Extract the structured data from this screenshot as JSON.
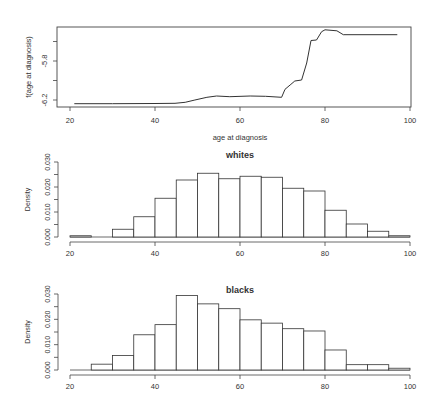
{
  "colors": {
    "ink": "#444444",
    "bar_fill": "#ffffff",
    "background": "#ffffff"
  },
  "chart_data": [
    {
      "type": "line",
      "title": "",
      "xlabel": "age at diagnosis",
      "ylabel": "f(age at diagnosis)",
      "xlim": [
        20,
        100
      ],
      "ylim": [
        -6.25,
        -5.45
      ],
      "xticks": [
        20,
        40,
        60,
        80,
        100
      ],
      "yticks": [
        -6.2,
        -6.0,
        -5.8,
        -5.6
      ],
      "ytick_labels": [
        "-6.2",
        "",
        "-5.8",
        ""
      ],
      "grid": false,
      "series": [
        {
          "name": "f(age at diagnosis)",
          "x": [
            21,
            30,
            40,
            44.7,
            47.1,
            49.4,
            52.2,
            54.5,
            57.6,
            62.4,
            66,
            69.8,
            70.6,
            71.8,
            72.9,
            74.5,
            75.7,
            76.7,
            78.0,
            79.2,
            80.0,
            82.8,
            84.3,
            97.0
          ],
          "y": [
            -6.238,
            -6.238,
            -6.236,
            -6.234,
            -6.224,
            -6.2,
            -6.172,
            -6.159,
            -6.166,
            -6.159,
            -6.162,
            -6.172,
            -6.09,
            -6.046,
            -6.005,
            -5.995,
            -5.82,
            -5.59,
            -5.585,
            -5.5,
            -5.48,
            -5.49,
            -5.53,
            -5.53
          ]
        }
      ]
    },
    {
      "type": "bar",
      "title": "whites",
      "xlabel": "",
      "ylabel": "Density",
      "xlim": [
        20,
        100
      ],
      "ylim": [
        0,
        0.031
      ],
      "xticks": [
        20,
        40,
        60,
        80,
        100
      ],
      "yticks": [
        0,
        0.005,
        0.01,
        0.015,
        0.02,
        0.025,
        0.03
      ],
      "ytick_labels": [
        "0.000",
        "",
        "0.010",
        "",
        "0.020",
        "",
        "0.030"
      ],
      "bin_edges": [
        20,
        25,
        30,
        35,
        40,
        45,
        50,
        55,
        60,
        65,
        70,
        75,
        80,
        85,
        90,
        95,
        100
      ],
      "categories": [
        "20-25",
        "25-30",
        "30-35",
        "35-40",
        "40-45",
        "45-50",
        "50-55",
        "55-60",
        "60-65",
        "65-70",
        "70-75",
        "75-80",
        "80-85",
        "85-90",
        "90-95",
        "95-100"
      ],
      "values": [
        0.0005,
        0.0,
        0.0031,
        0.0081,
        0.0155,
        0.0228,
        0.0255,
        0.0233,
        0.0243,
        0.0239,
        0.0195,
        0.0184,
        0.0107,
        0.0052,
        0.0023,
        0.0005
      ]
    },
    {
      "type": "bar",
      "title": "blacks",
      "xlabel": "",
      "ylabel": "Density",
      "xlim": [
        20,
        100
      ],
      "ylim": [
        0,
        0.031
      ],
      "xticks": [
        20,
        40,
        60,
        80,
        100
      ],
      "yticks": [
        0,
        0.005,
        0.01,
        0.015,
        0.02,
        0.025,
        0.03
      ],
      "ytick_labels": [
        "0.000",
        "",
        "0.010",
        "",
        "0.020",
        "",
        "0.030"
      ],
      "bin_edges": [
        20,
        25,
        30,
        35,
        40,
        45,
        50,
        55,
        60,
        65,
        70,
        75,
        80,
        85,
        90,
        95,
        100
      ],
      "categories": [
        "20-25",
        "25-30",
        "30-35",
        "35-40",
        "40-45",
        "45-50",
        "50-55",
        "55-60",
        "60-65",
        "65-70",
        "70-75",
        "75-80",
        "80-85",
        "85-90",
        "90-95",
        "95-100"
      ],
      "values": [
        0.0,
        0.0023,
        0.0057,
        0.0139,
        0.0179,
        0.0294,
        0.0261,
        0.0242,
        0.0198,
        0.0185,
        0.0163,
        0.0154,
        0.0079,
        0.0021,
        0.0021,
        0.0007
      ]
    }
  ]
}
